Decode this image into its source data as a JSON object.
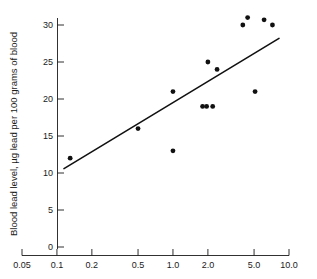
{
  "chart_data": {
    "type": "scatter",
    "title": "",
    "xlabel": "",
    "ylabel": "Blood lead level, µg lead per 100 grams of blood",
    "x_scale": "log",
    "y_scale": "linear",
    "xlim": [
      0.05,
      10.0
    ],
    "ylim": [
      0,
      31.5
    ],
    "grid": false,
    "legend": null,
    "xticks": [
      0.05,
      0.1,
      0.2,
      0.5,
      1.0,
      2.0,
      5.0,
      10.0
    ],
    "xticklabels": [
      "0.05",
      "0.1",
      "0.2",
      "0.5",
      "1.0",
      "2.0",
      "5.0",
      "10.0"
    ],
    "yticks": [
      0,
      5,
      10,
      15,
      20,
      25,
      30
    ],
    "yticklabels": [
      "0",
      "5",
      "10",
      "15",
      "20",
      "25",
      "30"
    ],
    "points": [
      {
        "x": 0.13,
        "y": 12
      },
      {
        "x": 0.5,
        "y": 16
      },
      {
        "x": 1.0,
        "y": 21
      },
      {
        "x": 1.0,
        "y": 13
      },
      {
        "x": 1.8,
        "y": 19
      },
      {
        "x": 2.0,
        "y": 25
      },
      {
        "x": 2.2,
        "y": 19
      },
      {
        "x": 2.4,
        "y": 24
      },
      {
        "x": 4.0,
        "y": 30
      },
      {
        "x": 4.4,
        "y": 31
      },
      {
        "x": 5.1,
        "y": 21
      },
      {
        "x": 6.1,
        "y": 30.7
      },
      {
        "x": 7.2,
        "y": 30
      },
      {
        "x": 1.95,
        "y": 19
      }
    ],
    "fit_line": {
      "type": "linear-on-log-x",
      "x_start": 0.115,
      "y_start": 10.6,
      "x_end": 8.2,
      "y_end": 28.2
    },
    "colors": {
      "point": "#111111",
      "line": "#111111",
      "axis": "#1a1a1a",
      "background": "#ffffff"
    }
  }
}
